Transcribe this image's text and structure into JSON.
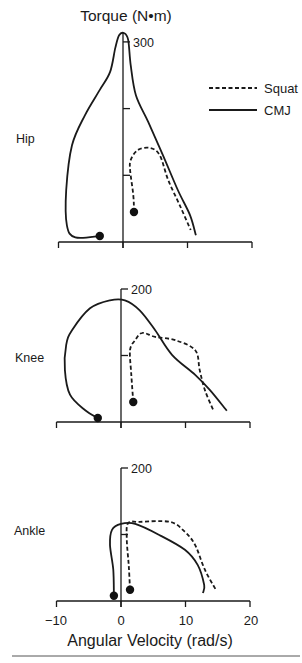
{
  "figure": {
    "ytitle": "Torque (N•m)",
    "xlabel": "Angular Velocity (rad/s)",
    "legend": [
      {
        "label": "Squat",
        "style": "dashed"
      },
      {
        "label": "CMJ",
        "style": "solid"
      }
    ],
    "x_tick_labels": [
      "−10",
      "0",
      "10",
      "20"
    ]
  },
  "chart_data": [
    {
      "type": "line",
      "title": "Hip",
      "xlabel": "Angular Velocity (rad/s)",
      "ylabel": "Torque (N•m)",
      "xlim": [
        -10,
        20
      ],
      "ylim": [
        0,
        300
      ],
      "x_ticks": [
        -10,
        0,
        10,
        20
      ],
      "y_ticks": [
        100,
        200,
        300
      ],
      "y_tick_labels_shown": [
        "300"
      ],
      "legend_position": "upper right",
      "grid": false,
      "series": [
        {
          "name": "CMJ",
          "style": "solid",
          "points": [
            [
              -3.6,
              9
            ],
            [
              -7.4,
              7
            ],
            [
              -8.7,
              25
            ],
            [
              -8.8,
              78
            ],
            [
              -7.9,
              145
            ],
            [
              -5.9,
              190
            ],
            [
              -3.6,
              228
            ],
            [
              -2.0,
              255
            ],
            [
              -1.2,
              291
            ],
            [
              -0.6,
              310
            ],
            [
              0.2,
              313
            ],
            [
              0.8,
              303
            ],
            [
              1.2,
              265
            ],
            [
              2.0,
              220
            ],
            [
              3.9,
              180
            ],
            [
              6.2,
              130
            ],
            [
              8.5,
              78
            ],
            [
              10.4,
              40
            ],
            [
              11.3,
              10
            ]
          ],
          "start_marker": [
            -3.6,
            9
          ]
        },
        {
          "name": "Squat",
          "style": "dashed",
          "points": [
            [
              1.7,
              45
            ],
            [
              1.6,
              70
            ],
            [
              1.1,
              108
            ],
            [
              1.2,
              123
            ],
            [
              2.3,
              138
            ],
            [
              4.2,
              141
            ],
            [
              5.7,
              130
            ],
            [
              7.0,
              93
            ],
            [
              8.8,
              55
            ],
            [
              10.5,
              18
            ]
          ],
          "start_marker": [
            1.7,
            45
          ]
        }
      ]
    },
    {
      "type": "line",
      "title": "Knee",
      "xlabel": "Angular Velocity (rad/s)",
      "ylabel": "Torque (N•m)",
      "xlim": [
        -10,
        20
      ],
      "ylim": [
        0,
        200
      ],
      "x_ticks": [
        -10,
        0,
        10,
        20
      ],
      "y_ticks": [
        100,
        200
      ],
      "y_tick_labels_shown": [
        "200"
      ],
      "grid": false,
      "series": [
        {
          "name": "CMJ",
          "style": "solid",
          "points": [
            [
              -3.6,
              6
            ],
            [
              -5.6,
              18
            ],
            [
              -7.9,
              41
            ],
            [
              -8.7,
              78
            ],
            [
              -8.5,
              116
            ],
            [
              -7.6,
              138
            ],
            [
              -4.8,
              171
            ],
            [
              -1.7,
              183
            ],
            [
              0.6,
              183
            ],
            [
              2.9,
              168
            ],
            [
              5.3,
              138
            ],
            [
              7.9,
              101
            ],
            [
              11.5,
              71
            ],
            [
              13.8,
              48
            ],
            [
              16.4,
              17
            ]
          ],
          "start_marker": [
            -3.6,
            6
          ]
        },
        {
          "name": "Squat",
          "style": "dashed",
          "points": [
            [
              1.9,
              30
            ],
            [
              1.6,
              71
            ],
            [
              1.4,
              108
            ],
            [
              2.2,
              123
            ],
            [
              3.3,
              134
            ],
            [
              5.3,
              128
            ],
            [
              8.4,
              123
            ],
            [
              11.5,
              108
            ],
            [
              12.2,
              78
            ],
            [
              13.0,
              48
            ],
            [
              14.3,
              18
            ]
          ],
          "start_marker": [
            1.9,
            30
          ]
        }
      ]
    },
    {
      "type": "line",
      "title": "Ankle",
      "xlabel": "Angular Velocity (rad/s)",
      "ylabel": "Torque (N•m)",
      "xlim": [
        -10,
        20
      ],
      "ylim": [
        0,
        200
      ],
      "x_ticks": [
        -10,
        0,
        10,
        20
      ],
      "x_tick_labels": [
        "−10",
        "0",
        "10",
        "20"
      ],
      "y_ticks": [
        100,
        200
      ],
      "y_tick_labels_shown": [
        "200"
      ],
      "grid": false,
      "series": [
        {
          "name": "CMJ",
          "style": "solid",
          "points": [
            [
              -1.1,
              8
            ],
            [
              -1.2,
              47
            ],
            [
              -1.7,
              84
            ],
            [
              -1.4,
              107
            ],
            [
              0,
              116
            ],
            [
              2.2,
              116
            ],
            [
              6.0,
              99
            ],
            [
              9.9,
              77
            ],
            [
              11.9,
              54
            ],
            [
              12.9,
              24
            ],
            [
              12.7,
              12
            ]
          ],
          "start_marker": [
            -1.1,
            8
          ]
        },
        {
          "name": "Squat",
          "style": "dashed",
          "points": [
            [
              1.4,
              17
            ],
            [
              1.2,
              54
            ],
            [
              0.9,
              92
            ],
            [
              1.1,
              117
            ],
            [
              2.9,
              119
            ],
            [
              7.6,
              119
            ],
            [
              9.9,
              104
            ],
            [
              11.5,
              84
            ],
            [
              13.0,
              47
            ],
            [
              14.7,
              17
            ]
          ],
          "start_marker": [
            1.4,
            17
          ]
        }
      ]
    }
  ]
}
